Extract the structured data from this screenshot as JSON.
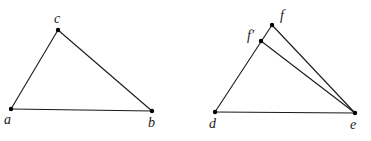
{
  "diagram": {
    "figures": [
      {
        "name": "triangle-abc",
        "points": {
          "a": {
            "label": "a",
            "x": 11,
            "y": 109,
            "label_x": 4,
            "label_y": 124
          },
          "b": {
            "label": "b",
            "x": 152,
            "y": 111,
            "label_x": 148,
            "label_y": 127
          },
          "c": {
            "label": "c",
            "x": 58,
            "y": 30,
            "label_x": 54,
            "label_y": 23
          }
        },
        "edges": [
          [
            "a",
            "b"
          ],
          [
            "b",
            "c"
          ],
          [
            "c",
            "a"
          ]
        ]
      },
      {
        "name": "triangle-def-with-fprime",
        "points": {
          "d": {
            "label": "d",
            "x": 215,
            "y": 112,
            "label_x": 209,
            "label_y": 128
          },
          "e": {
            "label": "e",
            "x": 355,
            "y": 113,
            "label_x": 350,
            "label_y": 129
          },
          "f": {
            "label": "f",
            "x": 272,
            "y": 25,
            "label_x": 280,
            "label_y": 20
          },
          "fprime": {
            "label": "f′",
            "x": 261,
            "y": 41,
            "label_x": 247,
            "label_y": 40
          }
        },
        "edges": [
          [
            "d",
            "e"
          ],
          [
            "d",
            "f"
          ],
          [
            "f",
            "e"
          ],
          [
            "fprime",
            "e"
          ]
        ]
      }
    ],
    "colors": {
      "line": "#1a1a1a",
      "point": "#000000",
      "background": "#ffffff"
    }
  }
}
